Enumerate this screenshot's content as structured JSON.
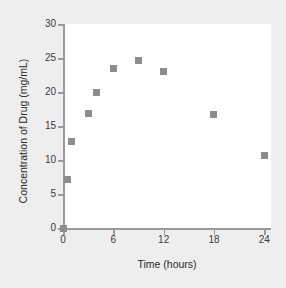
{
  "chart_data": {
    "type": "scatter",
    "title": "",
    "xlabel": "Time (hours)",
    "ylabel": "Concentration of Drug (mg/mL)",
    "xlim": [
      0,
      24.8
    ],
    "ylim": [
      0,
      30
    ],
    "xticks": [
      0,
      6,
      12,
      18,
      24
    ],
    "yticks": [
      0,
      5,
      10,
      15,
      20,
      25,
      30
    ],
    "grid": false,
    "legend": null,
    "marker": "square",
    "marker_color": "#8d8d8d",
    "axis_color": "#9a9a9a",
    "background": "#eeeeee",
    "panel_background": "#ffffff",
    "x": [
      0,
      0.5,
      1,
      3,
      4,
      6,
      9,
      12,
      18,
      24
    ],
    "y": [
      0,
      7.1,
      12.7,
      16.9,
      19.9,
      23.4,
      24.6,
      23.0,
      16.7,
      10.7
    ],
    "points": [
      {
        "x": 0,
        "y": 0.0
      },
      {
        "x": 0.5,
        "y": 7.1
      },
      {
        "x": 1,
        "y": 12.7
      },
      {
        "x": 3,
        "y": 16.9
      },
      {
        "x": 4,
        "y": 19.9
      },
      {
        "x": 6,
        "y": 23.4
      },
      {
        "x": 9,
        "y": 24.6
      },
      {
        "x": 12,
        "y": 23.0
      },
      {
        "x": 18,
        "y": 16.7
      },
      {
        "x": 24,
        "y": 10.7
      }
    ]
  }
}
